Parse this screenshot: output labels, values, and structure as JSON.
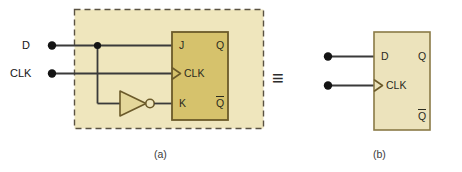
{
  "figure": {
    "panels": [
      {
        "id": "a",
        "caption": "(a)",
        "description": "JK flip-flop with inverter forming a D flip-flop",
        "inputs": [
          {
            "name": "D",
            "label": "D"
          },
          {
            "name": "CLK",
            "label": "CLK"
          }
        ],
        "device": {
          "type": "jk-flip-flop",
          "pins_left": [
            {
              "name": "J",
              "label": "J"
            },
            {
              "name": "CLK",
              "label": "CLK",
              "dynamic": true
            },
            {
              "name": "K",
              "label": "K"
            }
          ],
          "pins_right": [
            {
              "name": "Q",
              "label": "Q",
              "overbar": false
            },
            {
              "name": "Qbar",
              "label": "Q",
              "overbar": true
            }
          ]
        },
        "gate": {
          "type": "inverter",
          "label": "NOT",
          "bubble": true
        }
      },
      {
        "id": "b",
        "caption": "(b)",
        "description": "Equivalent D flip-flop symbol",
        "inputs": [
          {
            "name": "D",
            "label": "D"
          },
          {
            "name": "CLK",
            "label": "CLK"
          }
        ],
        "device": {
          "type": "d-flip-flop",
          "pins_left": [
            {
              "name": "D",
              "label": "D"
            },
            {
              "name": "CLK",
              "label": "CLK",
              "dynamic": true
            }
          ],
          "pins_right": [
            {
              "name": "Q",
              "label": "Q",
              "overbar": false
            },
            {
              "name": "Qbar",
              "label": "Q",
              "overbar": true
            }
          ]
        }
      }
    ],
    "equivalence_symbol": "≡",
    "colors": {
      "page_background": "#ffffff",
      "panel_fill": "#efe6bd",
      "panel_dash_border": "#5a5242",
      "jk_box_fill": "#d6c26c",
      "jk_box_stroke": "#6b5a2a",
      "d_box_fill": "#ece3bc",
      "d_box_stroke": "#8a7a46",
      "gate_fill": "#e4d79a",
      "gate_stroke": "#6b5a2a",
      "wire": "#3a3a3a",
      "terminal_dot": "#141414",
      "label_text": "#1a1a1a"
    }
  }
}
